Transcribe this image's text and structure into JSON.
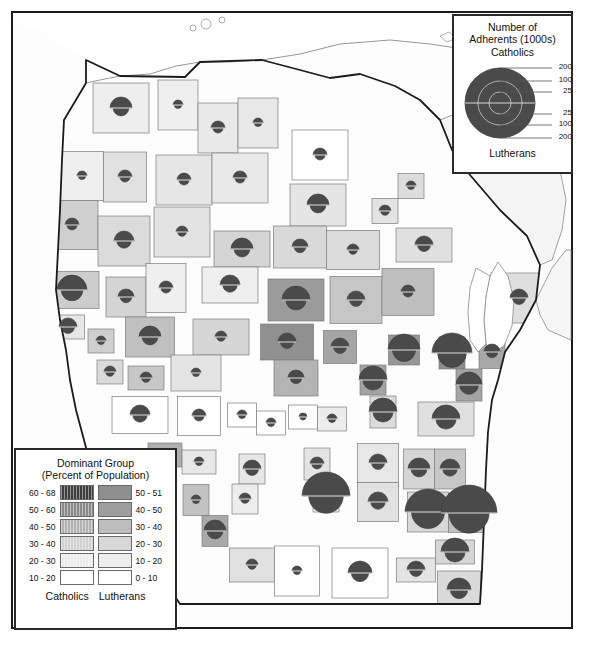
{
  "map": {
    "title_absent": true,
    "region": "Wisconsin",
    "background_color": "#fdfdfd",
    "frame_color": "#1b1b1b",
    "state_border_color": "#1b1b1b",
    "county_border_color": "#7d7d7d",
    "water_color": "#ffffff",
    "symbol_color": "#4a4a4a",
    "symbol_edge_color": "#3a3a3a"
  },
  "size_legend": {
    "title_line1": "Number of",
    "title_line2": "Adherents (1000s)",
    "top_label": "Catholics",
    "bottom_label": "Lutherans",
    "top_ticks": [
      "200",
      "100",
      "25"
    ],
    "bottom_ticks": [
      "25",
      "100",
      "200"
    ]
  },
  "class_legend": {
    "title_line1": "Dominant Group",
    "title_line2": "(Percent of Population)",
    "left_column_label": "Catholics",
    "right_column_label": "Lutherans",
    "rows": [
      {
        "left_label": "60 - 68",
        "left_color": "#3e3e3e",
        "right_label": "50 - 51",
        "right_color": "#8f8f8f"
      },
      {
        "left_label": "50 - 60",
        "left_color": "#8b8b8b",
        "right_label": "40 - 50",
        "right_color": "#9e9e9e"
      },
      {
        "left_label": "40 - 50",
        "left_color": "#b3b3b3",
        "right_label": "30 - 40",
        "right_color": "#bdbdbd"
      },
      {
        "left_label": "30 - 40",
        "left_color": "#d2d2d2",
        "right_label": "20 - 30",
        "right_color": "#d7d7d7"
      },
      {
        "left_label": "20 - 30",
        "left_color": "#ececec",
        "right_label": "10 - 20",
        "right_color": "#ededed"
      },
      {
        "left_label": "10 - 20",
        "left_color": "#ffffff",
        "right_label": "0 - 10",
        "right_color": "#ffffff"
      }
    ]
  },
  "chart_data": {
    "type": "map",
    "value_units": "thousands of adherents",
    "symbol_encoding": "Proportional circle split horizontally: upper half = Catholics, lower half = Lutherans; radius scaled by adherent count (25 / 100 / 200 thousand reference rings).",
    "choropleth_encoding": "County fill shade = percent of population in dominant group (darker = higher percent).",
    "counties": [
      {
        "name": "Douglas",
        "cx": 121,
        "cy": 108,
        "r": 11,
        "fill": "#eeeeee"
      },
      {
        "name": "Bayfield",
        "cx": 178,
        "cy": 105,
        "r": 5,
        "fill": "#efefef"
      },
      {
        "name": "Ashland",
        "cx": 218,
        "cy": 128,
        "r": 7,
        "fill": "#e9e9e9"
      },
      {
        "name": "Iron",
        "cx": 258,
        "cy": 123,
        "r": 5,
        "fill": "#e8e8e8"
      },
      {
        "name": "Vilas",
        "cx": 320,
        "cy": 155,
        "r": 7,
        "fill": "#ffffff"
      },
      {
        "name": "Burnett",
        "cx": 82,
        "cy": 176,
        "r": 5,
        "fill": "#efefef"
      },
      {
        "name": "Washburn",
        "cx": 125,
        "cy": 177,
        "r": 7,
        "fill": "#e1e1e1"
      },
      {
        "name": "Sawyer",
        "cx": 184,
        "cy": 180,
        "r": 7,
        "fill": "#e6e6e6"
      },
      {
        "name": "Price",
        "cx": 240,
        "cy": 178,
        "r": 7,
        "fill": "#e9e9e9"
      },
      {
        "name": "Oneida",
        "cx": 318,
        "cy": 205,
        "r": 11,
        "fill": "#e5e5e5"
      },
      {
        "name": "Forest",
        "cx": 385,
        "cy": 211,
        "r": 6,
        "fill": "#e3e3e3"
      },
      {
        "name": "Florence",
        "cx": 411,
        "cy": 186,
        "r": 5,
        "fill": "#dddddd"
      },
      {
        "name": "Polk",
        "cx": 72,
        "cy": 225,
        "r": 7,
        "fill": "#cfcfcf"
      },
      {
        "name": "Barron",
        "cx": 124,
        "cy": 241,
        "r": 10,
        "fill": "#dbdbdb"
      },
      {
        "name": "Rusk",
        "cx": 182,
        "cy": 232,
        "r": 6,
        "fill": "#e3e3e3"
      },
      {
        "name": "Taylor",
        "cx": 242,
        "cy": 249,
        "r": 11,
        "fill": "#d5d5d5"
      },
      {
        "name": "Lincoln",
        "cx": 300,
        "cy": 247,
        "r": 8,
        "fill": "#d9d9d9"
      },
      {
        "name": "Langlade",
        "cx": 353,
        "cy": 250,
        "r": 6,
        "fill": "#dcdcdc"
      },
      {
        "name": "Marinette",
        "cx": 424,
        "cy": 245,
        "r": 9,
        "fill": "#e0e0e0"
      },
      {
        "name": "St. Croix",
        "cx": 72,
        "cy": 290,
        "r": 15,
        "fill": "#cdcdcd"
      },
      {
        "name": "Dunn",
        "cx": 126,
        "cy": 297,
        "r": 8,
        "fill": "#d4d4d4"
      },
      {
        "name": "Chippewa",
        "cx": 166,
        "cy": 288,
        "r": 7,
        "fill": "#efefef"
      },
      {
        "name": "Clark",
        "cx": 230,
        "cy": 285,
        "r": 10,
        "fill": "#efefef"
      },
      {
        "name": "Marathon",
        "cx": 296,
        "cy": 300,
        "r": 14,
        "fill": "#9b9b9b"
      },
      {
        "name": "Shawano",
        "cx": 356,
        "cy": 300,
        "r": 9,
        "fill": "#c6c6c6"
      },
      {
        "name": "Oconto",
        "cx": 408,
        "cy": 292,
        "r": 7,
        "fill": "#bfbfbf"
      },
      {
        "name": "Door",
        "cx": 519,
        "cy": 298,
        "r": 9,
        "fill": "#dfdfdf"
      },
      {
        "name": "Pierce",
        "cx": 68,
        "cy": 327,
        "r": 9,
        "fill": "#e7e7e7"
      },
      {
        "name": "Pepin",
        "cx": 101,
        "cy": 341,
        "r": 5,
        "fill": "#cfcfcf"
      },
      {
        "name": "Eau Claire",
        "cx": 150,
        "cy": 337,
        "r": 11,
        "fill": "#c0c0c0"
      },
      {
        "name": "Wood",
        "cx": 221,
        "cy": 337,
        "r": 6,
        "fill": "#d6d6d6"
      },
      {
        "name": "Portage",
        "cx": 287,
        "cy": 342,
        "r": 9,
        "fill": "#909090"
      },
      {
        "name": "Waupaca",
        "cx": 340,
        "cy": 347,
        "r": 9,
        "fill": "#a5a5a5"
      },
      {
        "name": "Outagamie",
        "cx": 404,
        "cy": 350,
        "r": 16,
        "fill": "#969696"
      },
      {
        "name": "Brown",
        "cx": 452,
        "cy": 353,
        "r": 20,
        "fill": "#8c8c8c"
      },
      {
        "name": "Kewaunee",
        "cx": 492,
        "cy": 352,
        "r": 8,
        "fill": "#a8a8a8"
      },
      {
        "name": "Buffalo",
        "cx": 110,
        "cy": 372,
        "r": 6,
        "fill": "#dadada"
      },
      {
        "name": "Trempealeau",
        "cx": 146,
        "cy": 378,
        "r": 6,
        "fill": "#c7c7c7"
      },
      {
        "name": "Jackson",
        "cx": 196,
        "cy": 373,
        "r": 5,
        "fill": "#e4e4e4"
      },
      {
        "name": "Waushara",
        "cx": 296,
        "cy": 378,
        "r": 8,
        "fill": "#b4b4b4"
      },
      {
        "name": "Winnebago",
        "cx": 373,
        "cy": 380,
        "r": 14,
        "fill": "#a3a3a3"
      },
      {
        "name": "Manitowoc",
        "cx": 469,
        "cy": 385,
        "r": 13,
        "fill": "#a4a4a4"
      },
      {
        "name": "La Crosse",
        "cx": 140,
        "cy": 415,
        "r": 10,
        "fill": "#ffffff"
      },
      {
        "name": "Monroe",
        "cx": 199,
        "cy": 416,
        "r": 7,
        "fill": "#ffffff"
      },
      {
        "name": "Juneau",
        "cx": 242,
        "cy": 415,
        "r": 5,
        "fill": "#ffffff"
      },
      {
        "name": "Adams",
        "cx": 271,
        "cy": 423,
        "r": 5,
        "fill": "#ffffff"
      },
      {
        "name": "Marquette",
        "cx": 303,
        "cy": 417,
        "r": 4,
        "fill": "#ffffff"
      },
      {
        "name": "Green Lake",
        "cx": 332,
        "cy": 419,
        "r": 5,
        "fill": "#ededed"
      },
      {
        "name": "Fond du Lac",
        "cx": 383,
        "cy": 412,
        "r": 14,
        "fill": "#dcdcdc"
      },
      {
        "name": "Sheboygan",
        "cx": 446,
        "cy": 419,
        "r": 14,
        "fill": "#e0e0e0"
      },
      {
        "name": "Vernon",
        "cx": 165,
        "cy": 455,
        "r": 6,
        "fill": "#b0b0b0"
      },
      {
        "name": "Richland",
        "cx": 199,
        "cy": 462,
        "r": 5,
        "fill": "#e8e8e8"
      },
      {
        "name": "Sauk",
        "cx": 252,
        "cy": 469,
        "r": 9,
        "fill": "#e7e7e7"
      },
      {
        "name": "Columbia",
        "cx": 317,
        "cy": 464,
        "r": 7,
        "fill": "#e4e4e4"
      },
      {
        "name": "Dodge",
        "cx": 378,
        "cy": 463,
        "r": 9,
        "fill": "#e7e7e7"
      },
      {
        "name": "Washington",
        "cx": 419,
        "cy": 469,
        "r": 11,
        "fill": "#d5d5d5"
      },
      {
        "name": "Ozaukee",
        "cx": 450,
        "cy": 469,
        "r": 10,
        "fill": "#c7c7c7"
      },
      {
        "name": "Crawford",
        "cx": 196,
        "cy": 500,
        "r": 5,
        "fill": "#c2c2c2"
      },
      {
        "name": "Iowa",
        "cx": 245,
        "cy": 499,
        "r": 6,
        "fill": "#ededed"
      },
      {
        "name": "Dane",
        "cx": 326,
        "cy": 496,
        "r": 24,
        "fill": "#efefef"
      },
      {
        "name": "Jefferson",
        "cx": 378,
        "cy": 502,
        "r": 10,
        "fill": "#e1e1e1"
      },
      {
        "name": "Waukesha",
        "cx": 428,
        "cy": 512,
        "r": 23,
        "fill": "#d8d8d8"
      },
      {
        "name": "Milwaukee",
        "cx": 469,
        "cy": 513,
        "r": 28,
        "fill": "#c2c2c2"
      },
      {
        "name": "Grant",
        "cx": 215,
        "cy": 531,
        "r": 11,
        "fill": "#a9a9a9"
      },
      {
        "name": "Lafayette",
        "cx": 252,
        "cy": 565,
        "r": 6,
        "fill": "#e1e1e1"
      },
      {
        "name": "Green",
        "cx": 297,
        "cy": 571,
        "r": 5,
        "fill": "#ffffff"
      },
      {
        "name": "Rock",
        "cx": 360,
        "cy": 573,
        "r": 12,
        "fill": "#ffffff"
      },
      {
        "name": "Walworth",
        "cx": 416,
        "cy": 570,
        "r": 9,
        "fill": "#e4e4e4"
      },
      {
        "name": "Racine",
        "cx": 455,
        "cy": 552,
        "r": 14,
        "fill": "#d6d6d6"
      },
      {
        "name": "Kenosha",
        "cx": 459,
        "cy": 590,
        "r": 12,
        "fill": "#dadada"
      }
    ]
  }
}
